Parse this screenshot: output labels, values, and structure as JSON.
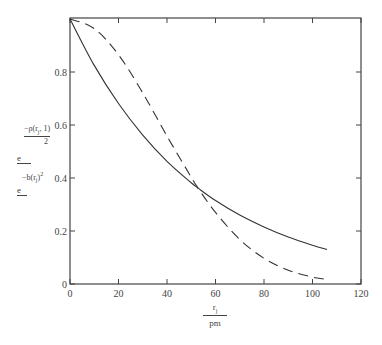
{
  "chart_data": {
    "type": "line",
    "title": "",
    "xlabel": "r_j / pm",
    "ylabel": "e^(-ρ(r_j,1)/2) , e^(-b(r_j)^2)",
    "xlim": [
      0,
      120
    ],
    "ylim": [
      0,
      1
    ],
    "x_ticks": [
      0,
      20,
      40,
      60,
      80,
      100,
      120
    ],
    "y_ticks": [
      0,
      0.2,
      0.4,
      0.6,
      0.8
    ],
    "grid": false,
    "legend": null,
    "series": [
      {
        "name": "e^(-ρ(r_j,1)/2)",
        "style": "solid",
        "x": [
          0,
          10,
          20,
          30,
          40,
          50,
          52.8,
          60,
          70,
          80,
          90,
          100,
          106
        ],
        "y": [
          1.0,
          0.825,
          0.681,
          0.562,
          0.463,
          0.382,
          0.362,
          0.315,
          0.26,
          0.215,
          0.177,
          0.146,
          0.13
        ]
      },
      {
        "name": "e^(-b(r_j)^2)",
        "style": "dashed",
        "x": [
          0,
          10,
          20,
          30,
          40,
          50,
          52.8,
          60,
          70,
          80,
          90,
          100,
          106
        ],
        "y": [
          1.0,
          0.964,
          0.865,
          0.721,
          0.558,
          0.403,
          0.362,
          0.27,
          0.168,
          0.097,
          0.052,
          0.026,
          0.017
        ]
      }
    ]
  },
  "axes": {
    "x_tick_labels": [
      "0",
      "20",
      "40",
      "60",
      "80",
      "100",
      "120"
    ],
    "y_tick_labels": [
      "0",
      "0.2",
      "0.4",
      "0.6",
      "0.8"
    ],
    "x_label_num": "r",
    "x_label_num_sub": "j",
    "x_label_den": "pm",
    "y_label_1_exp": "−ρ(r",
    "y_label_1_sub": "j",
    "y_label_1_exp_tail": ", 1)",
    "y_label_1_den": "2",
    "y_label_base": "e",
    "y_label_2_exp": "−b(r",
    "y_label_2_sub": "j",
    "y_label_2_exp_tail": ")",
    "y_label_2_pow": "2"
  },
  "colors": {
    "axis": "#444444",
    "line": "#333333",
    "background": "#ffffff"
  }
}
